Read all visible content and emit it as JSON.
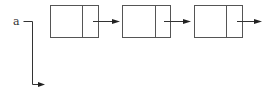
{
  "diagram": {
    "type": "linked-list",
    "pointer": {
      "label": "a"
    },
    "nodes": [
      {
        "id": "node-1",
        "has_next_arrow": true
      },
      {
        "id": "node-2",
        "has_next_arrow": true
      },
      {
        "id": "node-3",
        "has_next_arrow": true
      }
    ],
    "colors": {
      "stroke": "#555555",
      "arrow": "#222222",
      "background": "#ffffff"
    }
  }
}
